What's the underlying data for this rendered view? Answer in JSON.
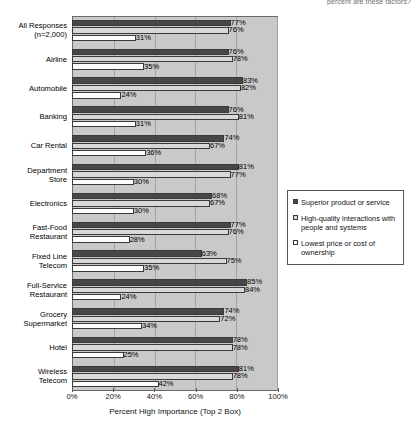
{
  "caption": "percent are these factors?",
  "chart_data": {
    "type": "bar",
    "orientation": "horizontal",
    "title": "",
    "xlabel": "Percent High Importance (Top 2 Box)",
    "ylabel": "",
    "xlim": [
      0,
      100
    ],
    "xticks": [
      "0%",
      "20%",
      "40%",
      "60%",
      "80%",
      "100%"
    ],
    "xtick_values": [
      0,
      20,
      40,
      60,
      80,
      100
    ],
    "grid": true,
    "legend_position": "right",
    "categories": [
      "All Responses\n(n=2,000)",
      "Airline",
      "Automobile",
      "Banking",
      "Car Rental",
      "Department Store",
      "Electronics",
      "Fast-Food Restaurant",
      "Fixed Line Telecom",
      "Full-Service Restaurant",
      "Grocery Supermarket",
      "Hotel",
      "Wireless Telecom"
    ],
    "category_lines": [
      [
        "All Responses",
        "(n=2,000)"
      ],
      [
        "Airline"
      ],
      [
        "Automobile"
      ],
      [
        "Banking"
      ],
      [
        "Car Rental"
      ],
      [
        "Department",
        "Store"
      ],
      [
        "Electronics"
      ],
      [
        "Fast-Food",
        "Restaurant"
      ],
      [
        "Fixed Line",
        "Telecom"
      ],
      [
        "Full-Service",
        "Restaurant"
      ],
      [
        "Grocery",
        "Supermarket"
      ],
      [
        "Hotel"
      ],
      [
        "Wireless",
        "Telecom"
      ]
    ],
    "series": [
      {
        "name": "Superior product or service",
        "color": "#474747",
        "values": [
          77,
          76,
          83,
          76,
          74,
          81,
          68,
          77,
          63,
          85,
          74,
          78,
          81
        ],
        "labels": [
          "77%",
          "76%",
          "83%",
          "76%",
          "74%",
          "81%",
          "68%",
          "77%",
          "63%",
          "85%",
          "74%",
          "78%",
          "81%"
        ]
      },
      {
        "name": "High-quality interactions with people and systems",
        "color": "#d8d8d8",
        "values": [
          76,
          78,
          82,
          81,
          67,
          77,
          67,
          76,
          75,
          84,
          72,
          78,
          78
        ],
        "labels": [
          "76%",
          "78%",
          "82%",
          "81%",
          "67%",
          "77%",
          "67%",
          "76%",
          "75%",
          "84%",
          "72%",
          "78%",
          "78%"
        ]
      },
      {
        "name": "Lowest price or cost of ownership",
        "color": "#fdfdfd",
        "values": [
          31,
          35,
          24,
          31,
          36,
          30,
          30,
          28,
          35,
          24,
          34,
          25,
          42
        ],
        "labels": [
          "31%",
          "35%",
          "24%",
          "31%",
          "36%",
          "30%",
          "30%",
          "28%",
          "35%",
          "24%",
          "34%",
          "25%",
          "42%"
        ]
      }
    ]
  },
  "legend": {
    "items": [
      {
        "label": "Superior product or service"
      },
      {
        "label": "High-quality interactions with people and systems"
      },
      {
        "label": "Lowest price or cost of ownership"
      }
    ]
  }
}
